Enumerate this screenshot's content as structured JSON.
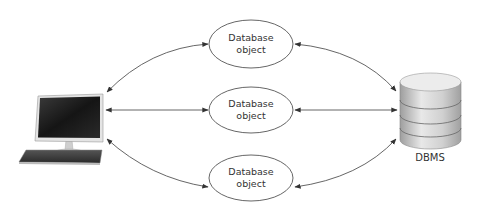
{
  "diagram": {
    "nodes": {
      "client": {
        "icon": "desktop-computer-icon"
      },
      "objects": [
        {
          "line1": "Database",
          "line2": "object"
        },
        {
          "line1": "Database",
          "line2": "object"
        },
        {
          "line1": "Database",
          "line2": "object"
        }
      ],
      "dbms": {
        "icon": "database-cylinder-icon",
        "label": "DBMS"
      }
    },
    "edges": [
      {
        "from": "client",
        "to": "object-1",
        "bidirectional": true,
        "style": "curved"
      },
      {
        "from": "client",
        "to": "object-2",
        "bidirectional": true,
        "style": "straight"
      },
      {
        "from": "client",
        "to": "object-3",
        "bidirectional": true,
        "style": "curved"
      },
      {
        "from": "object-1",
        "to": "dbms",
        "bidirectional": true,
        "style": "curved"
      },
      {
        "from": "object-2",
        "to": "dbms",
        "bidirectional": true,
        "style": "straight"
      },
      {
        "from": "object-3",
        "to": "dbms",
        "bidirectional": true,
        "style": "curved"
      }
    ],
    "colors": {
      "stroke": "#555555",
      "text": "#333333",
      "cylinder_light": "#e6e6e6",
      "cylinder_dark": "#a8a8a8",
      "monitor_screen": "#1a1a1a"
    }
  }
}
